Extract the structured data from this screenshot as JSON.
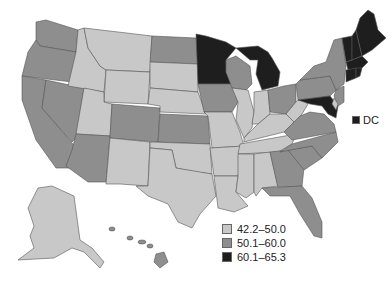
{
  "map": {
    "type": "choropleth",
    "region": "United States",
    "legend": [
      {
        "label": "42.2–50.0",
        "color": "#c8c8c8"
      },
      {
        "label": "50.1–60.0",
        "color": "#8e8e8e"
      },
      {
        "label": "60.1–65.3",
        "color": "#1e1e1e"
      }
    ],
    "dc_label": "DC",
    "dc_color": "#1e1e1e",
    "states": {
      "WA": "mid",
      "OR": "mid",
      "CA": "mid",
      "NV": "mid",
      "AZ": "mid",
      "ID": "light",
      "MT": "light",
      "WY": "light",
      "UT": "light",
      "NM": "light",
      "CO": "mid",
      "ND": "mid",
      "SD": "light",
      "NE": "light",
      "KS": "mid",
      "OK": "light",
      "TX": "light",
      "MN": "dark",
      "IA": "mid",
      "MO": "light",
      "AR": "light",
      "LA": "light",
      "WI": "mid",
      "IL": "light",
      "MI": "dark",
      "IN": "light",
      "OH": "mid",
      "KY": "light",
      "TN": "light",
      "MS": "light",
      "AL": "light",
      "GA": "mid",
      "FL": "mid",
      "SC": "mid",
      "NC": "mid",
      "VA": "mid",
      "WV": "light",
      "PA": "mid",
      "NY": "mid",
      "NJ": "mid",
      "DE": "light",
      "MD": "dark",
      "CT": "dark",
      "RI": "dark",
      "MA": "dark",
      "VT": "dark",
      "NH": "dark",
      "ME": "dark",
      "AK": "light",
      "HI": "mid",
      "DC": "dark"
    }
  }
}
